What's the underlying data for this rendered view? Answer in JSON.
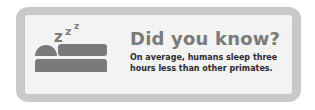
{
  "card": {
    "title": "Did you know?",
    "body_lines": [
      "On average, humans sleep three",
      "hours less than other primates."
    ],
    "icon": "sleeping-in-bed-icon",
    "zzz": "zzz"
  },
  "colors": {
    "frame": "#c9c9c9",
    "panel": "#f3f3f3",
    "icon": "#7a7a7a",
    "title": "#7a7a7a",
    "body": "#2b2b2b"
  }
}
